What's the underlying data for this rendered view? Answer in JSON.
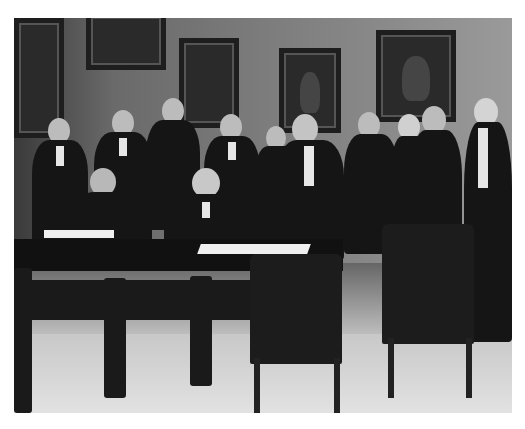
{
  "image": {
    "description": "Black-and-white historical photograph of a group of men in formal dress gathered around a desk while a seated man signs a document",
    "style": "monochrome",
    "scene": {
      "setting": "office interior with framed portraits on wall",
      "seated_figures": 2,
      "standing_figures": 11,
      "objects": [
        "desk",
        "inkstand",
        "documents",
        "carved wooden chairs",
        "framed portraits"
      ]
    },
    "watermark": ""
  }
}
